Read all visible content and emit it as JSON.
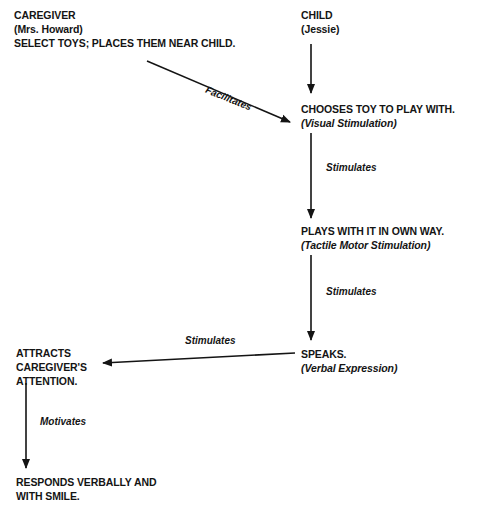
{
  "diagram": {
    "nodes": {
      "caregiver": {
        "title": "CAREGIVER",
        "name": "(Mrs. Howard)",
        "action": "SELECT TOYS; PLACES THEM NEAR CHILD."
      },
      "child": {
        "title": "CHILD",
        "name": "(Jessie)"
      },
      "chooses_toy": {
        "text": "CHOOSES TOY TO PLAY WITH.",
        "sub": "(Visual Stimulation)"
      },
      "plays": {
        "text": "PLAYS WITH IT IN OWN WAY.",
        "sub": "(Tactile Motor Stimulation)"
      },
      "speaks": {
        "text": "SPEAKS.",
        "sub": "(Verbal Expression)"
      },
      "attracts": {
        "line1": "ATTRACTS",
        "line2": "CAREGIVER'S",
        "line3": "ATTENTION."
      },
      "responds": {
        "line1": "RESPONDS VERBALLY AND",
        "line2": "WITH SMILE."
      }
    },
    "edges": {
      "facilitates": "Facilitates",
      "stimulates_1": "Stimulates",
      "stimulates_2": "Stimulates",
      "stimulates_3": "Stimulates",
      "motivates": "Motivates"
    },
    "colors": {
      "ink": "#141414",
      "background": "#ffffff"
    }
  }
}
